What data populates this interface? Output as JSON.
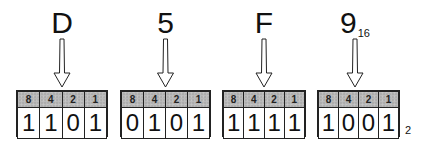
{
  "diagram": {
    "title_subscript": "16",
    "result_subscript": "2",
    "weights": [
      "8",
      "4",
      "2",
      "1"
    ],
    "nibbles": [
      {
        "hex": "D",
        "bits": [
          "1",
          "1",
          "0",
          "1"
        ]
      },
      {
        "hex": "5",
        "bits": [
          "0",
          "1",
          "0",
          "1"
        ]
      },
      {
        "hex": "F",
        "bits": [
          "1",
          "1",
          "1",
          "1"
        ]
      },
      {
        "hex": "9",
        "bits": [
          "1",
          "0",
          "0",
          "1"
        ]
      }
    ]
  }
}
